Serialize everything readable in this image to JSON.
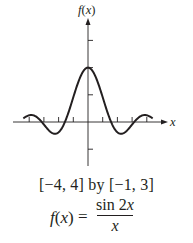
{
  "chart_data": {
    "type": "line",
    "title": "",
    "function": "f(x) = sin 2x / x",
    "xlabel": "x",
    "ylabel": "f(x)",
    "xlim": [
      -4,
      4
    ],
    "ylim": [
      -1,
      3
    ],
    "x_ticks": [
      -4,
      -3,
      -2,
      -1,
      1,
      2,
      3,
      4
    ],
    "y_ticks": [
      -1,
      1,
      2,
      3
    ],
    "grid": false,
    "legend": null,
    "series": [
      {
        "name": "f(x)",
        "x": [
          -4.4,
          -4,
          -3.5,
          -3,
          -2.5,
          -2,
          -1.5,
          -1,
          -0.5,
          0,
          0.5,
          1,
          1.5,
          2,
          2.5,
          3,
          3.5,
          4,
          4.4
        ],
        "values": [
          0.13,
          0.25,
          0.19,
          -0.09,
          0.38,
          -0.38,
          0.09,
          0.91,
          1.68,
          2.0,
          1.68,
          0.91,
          0.09,
          -0.38,
          -0.38,
          -0.09,
          0.19,
          0.25,
          0.13
        ]
      }
    ],
    "color": "#231f20"
  },
  "labels": {
    "y_axis": "f(x)",
    "x_axis": "x",
    "window": "[−4, 4] by [−1, 3]",
    "formula_lhs_f": "f",
    "formula_lhs_open": "(",
    "formula_lhs_x": "x",
    "formula_lhs_close": ")",
    "formula_eq": "=",
    "formula_num_sin": "sin 2",
    "formula_num_x": "x",
    "formula_den": "x"
  }
}
